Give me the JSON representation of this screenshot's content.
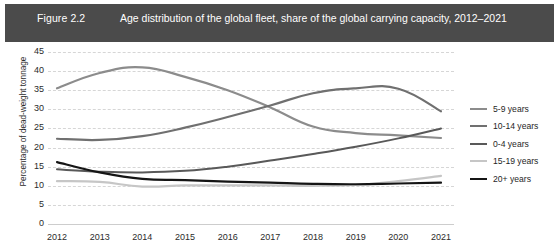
{
  "figure": {
    "number": "Figure 2.2",
    "title": "Age distribution of the global fleet, share of the global carrying capacity, 2012–2021",
    "band_color": "#4b4b4b"
  },
  "chart_data": {
    "type": "line",
    "title": "Age distribution of the global fleet, share of the global carrying capacity, 2012–2021",
    "xlabel": "",
    "ylabel": "Percentage of dead-weight tonnage",
    "categories": [
      "2012",
      "2013",
      "2014",
      "2015",
      "2016",
      "2017",
      "2018",
      "2019",
      "2020",
      "2021"
    ],
    "x": [
      2012,
      2013,
      2014,
      2015,
      2016,
      2017,
      2018,
      2019,
      2020,
      2021
    ],
    "ylim": [
      0,
      45
    ],
    "yticks": [
      0,
      5,
      10,
      15,
      20,
      25,
      30,
      35,
      40,
      45
    ],
    "grid": true,
    "legend_position": "right",
    "series": [
      {
        "name": "5-9 years",
        "color": "#8c8c8c",
        "width": 2.2,
        "values": [
          35.5,
          39.5,
          41.0,
          38.5,
          35.0,
          30.5,
          25.5,
          23.8,
          23.2,
          22.5
        ]
      },
      {
        "name": "10-14 years",
        "color": "#707070",
        "width": 2.2,
        "values": [
          22.3,
          22.0,
          23.0,
          25.2,
          28.0,
          31.0,
          34.2,
          35.5,
          35.4,
          29.5
        ]
      },
      {
        "name": "0-4 years",
        "color": "#595959",
        "width": 2.0,
        "values": [
          14.3,
          13.7,
          13.5,
          13.9,
          15.0,
          16.6,
          18.3,
          20.2,
          22.4,
          25.0
        ]
      },
      {
        "name": "15-19 years",
        "color": "#c6c6c6",
        "width": 2.2,
        "values": [
          11.2,
          11.0,
          9.8,
          10.1,
          10.1,
          10.1,
          10.0,
          10.2,
          11.2,
          12.6
        ]
      },
      {
        "name": "20+ years",
        "color": "#151515",
        "width": 2.2,
        "values": [
          16.2,
          13.5,
          11.8,
          11.5,
          11.1,
          10.8,
          10.5,
          10.4,
          10.6,
          10.8
        ]
      }
    ]
  },
  "legend": {
    "items": [
      {
        "label": "5-9 years",
        "color": "#8c8c8c"
      },
      {
        "label": "10-14 years",
        "color": "#707070"
      },
      {
        "label": "0-4 years",
        "color": "#595959"
      },
      {
        "label": "15-19 years",
        "color": "#c6c6c6"
      },
      {
        "label": "20+ years",
        "color": "#151515"
      }
    ]
  }
}
